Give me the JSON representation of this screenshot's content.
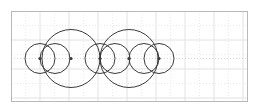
{
  "figure": {
    "type": "geometry-diagram",
    "background_color": "#ffffff",
    "canvas": {
      "width": 257,
      "height": 109
    }
  },
  "frame": {
    "name": "plot-border",
    "x": 11,
    "y": 11,
    "width": 237,
    "height": 91,
    "stroke_color": "#b8b8b8",
    "stroke_width": 1,
    "fill": "#ffffff"
  },
  "grid": {
    "name": "background-grid",
    "spacing": 14.5,
    "origin_x": 11,
    "origin_y": 11,
    "major_color": "#e2e2e2",
    "minor_color": "#ebebeb",
    "dash_pattern": "1 2",
    "vertical_count": 17,
    "horizontal_count": 7,
    "visible": true
  },
  "axis": {
    "name": "horizontal-centerline",
    "y": 58.5,
    "color": "#d8d8d8"
  },
  "shapes": {
    "stroke_color": "#3a3a3a",
    "stroke_width": 1,
    "fill": "none",
    "small_circles": [
      {
        "label": "small-circle-1",
        "cx": 40,
        "cy": 58.5,
        "r": 15
      },
      {
        "label": "small-circle-2",
        "cx": 100,
        "cy": 58.5,
        "r": 15
      },
      {
        "label": "small-circle-3",
        "cx": 115,
        "cy": 58.5,
        "r": 15
      },
      {
        "label": "small-circle-4",
        "cx": 159,
        "cy": 58.5,
        "r": 15
      }
    ],
    "large_circles": [
      {
        "label": "large-circle-left",
        "cx": 71,
        "cy": 58.5,
        "r": 29
      },
      {
        "label": "large-circle-right",
        "cx": 129,
        "cy": 58.5,
        "r": 29
      }
    ],
    "extra_circles": [
      {
        "label": "small-circle-5",
        "cx": 55,
        "cy": 58.5,
        "r": 15
      },
      {
        "label": "small-circle-6",
        "cx": 144,
        "cy": 58.5,
        "r": 15
      }
    ]
  },
  "center_dots": {
    "name": "center-point-markers",
    "color": "#3a3a3a",
    "radius": 1.6,
    "points": [
      {
        "label": "dot-small-left",
        "cx": 40,
        "cy": 58.5
      },
      {
        "label": "dot-large-left",
        "cx": 71,
        "cy": 58.5
      },
      {
        "label": "dot-small-mid",
        "cx": 100,
        "cy": 58.5
      },
      {
        "label": "dot-large-right",
        "cx": 129,
        "cy": 58.5
      },
      {
        "label": "dot-small-right",
        "cx": 159,
        "cy": 58.5
      }
    ]
  }
}
